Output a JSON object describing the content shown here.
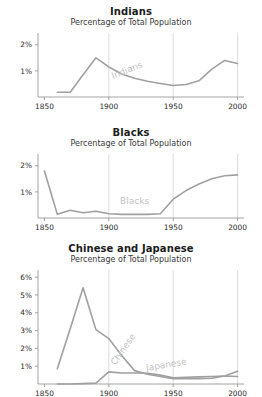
{
  "figure": {
    "background_color": "#ffffff",
    "line_color": "#a0a0a0",
    "label_color": "#c2c2c2",
    "axis_color": "#9a9a9a",
    "grid_color": "#d8d8d8",
    "subtitle": "Percentage of Total Population"
  },
  "charts": [
    {
      "id": "indians",
      "title": "Indians",
      "subtitle": "Percentage of Total Population",
      "inline_labels": [
        {
          "text": "Indians",
          "x": 1915,
          "y": 0.92,
          "rotate": -22
        }
      ],
      "chart_data": {
        "type": "line",
        "title": "Indians",
        "subtitle": "Percentage of Total Population",
        "xlabel": "",
        "ylabel": "Percentage of Total Population",
        "xlim": [
          1845,
          2005
        ],
        "ylim": [
          0,
          2.45
        ],
        "xticks": [
          1850,
          1900,
          1950,
          2000
        ],
        "xticklabels": [
          "1850",
          "1900",
          "1950",
          "2000"
        ],
        "yticks": [
          1,
          2
        ],
        "yticklabels": [
          "1%",
          "2%"
        ],
        "grid": "vertical-at-1900-1950-2000",
        "legend": "inline",
        "series": [
          {
            "name": "Indians",
            "x": [
              1860,
              1870,
              1880,
              1890,
              1900,
              1910,
              1920,
              1930,
              1940,
              1950,
              1960,
              1970,
              1980,
              1990,
              2000
            ],
            "values": [
              0.18,
              0.18,
              0.85,
              1.5,
              1.15,
              0.88,
              0.72,
              0.6,
              0.52,
              0.44,
              0.48,
              0.62,
              1.07,
              1.4,
              1.28
            ]
          }
        ]
      }
    },
    {
      "id": "blacks",
      "title": "Blacks",
      "subtitle": "Percentage of Total Population",
      "inline_labels": [
        {
          "text": "Blacks",
          "x": 1920,
          "y": 0.55,
          "rotate": 0
        }
      ],
      "chart_data": {
        "type": "line",
        "title": "Blacks",
        "subtitle": "Percentage of Total Population",
        "xlabel": "",
        "ylabel": "Percentage of Total Population",
        "xlim": [
          1845,
          2005
        ],
        "ylim": [
          0,
          2.45
        ],
        "xticks": [
          1850,
          1900,
          1950,
          2000
        ],
        "xticklabels": [
          "1850",
          "1900",
          "1950",
          "2000"
        ],
        "yticks": [
          1,
          2
        ],
        "yticklabels": [
          "1%",
          "2%"
        ],
        "grid": "vertical-at-1900-1950-2000",
        "legend": "inline",
        "series": [
          {
            "name": "Blacks",
            "x": [
              1850,
              1860,
              1870,
              1880,
              1890,
              1900,
              1910,
              1920,
              1930,
              1940,
              1950,
              1960,
              1970,
              1980,
              1990,
              2000
            ],
            "values": [
              1.8,
              0.14,
              0.3,
              0.2,
              0.26,
              0.16,
              0.14,
              0.14,
              0.14,
              0.16,
              0.72,
              1.05,
              1.3,
              1.5,
              1.62,
              1.65
            ]
          }
        ]
      }
    },
    {
      "id": "chinese-and-japanese",
      "title": "Chinese and Japanese",
      "subtitle": "Percentage of Total Population",
      "inline_labels": [
        {
          "text": "Chinese",
          "x": 1913,
          "y": 1.85,
          "rotate": -55
        },
        {
          "text": "Japanese",
          "x": 1945,
          "y": 0.92,
          "rotate": -9
        }
      ],
      "chart_data": {
        "type": "line",
        "title": "Chinese and Japanese",
        "subtitle": "Percentage of Total Population",
        "xlabel": "",
        "ylabel": "Percentage of Total Population",
        "xlim": [
          1845,
          2005
        ],
        "ylim": [
          0,
          6.4
        ],
        "xticks": [
          1850,
          1900,
          1950,
          2000
        ],
        "xticklabels": [
          "1850",
          "1900",
          "1950",
          "2000"
        ],
        "yticks": [
          1,
          2,
          3,
          4,
          5,
          6
        ],
        "yticklabels": [
          "1%",
          "2%",
          "3%",
          "4%",
          "5%",
          "6%"
        ],
        "grid": "vertical-at-1900-1950-2000",
        "legend": "inline",
        "series": [
          {
            "name": "Chinese",
            "x": [
              1860,
              1870,
              1880,
              1890,
              1900,
              1910,
              1920,
              1930,
              1940,
              1950,
              1960,
              1970,
              1980,
              1990,
              2000
            ],
            "values": [
              0.85,
              3.1,
              5.4,
              3.05,
              2.55,
              1.6,
              0.75,
              0.55,
              0.42,
              0.3,
              0.3,
              0.3,
              0.32,
              0.45,
              0.72
            ]
          },
          {
            "name": "Japanese",
            "x": [
              1860,
              1870,
              1880,
              1890,
              1900,
              1910,
              1920,
              1930,
              1940,
              1950,
              1960,
              1970,
              1980,
              1990,
              2000
            ],
            "values": [
              0.0,
              0.0,
              0.02,
              0.05,
              0.68,
              0.62,
              0.62,
              0.6,
              0.5,
              0.35,
              0.38,
              0.4,
              0.42,
              0.45,
              0.42
            ]
          }
        ]
      }
    }
  ]
}
